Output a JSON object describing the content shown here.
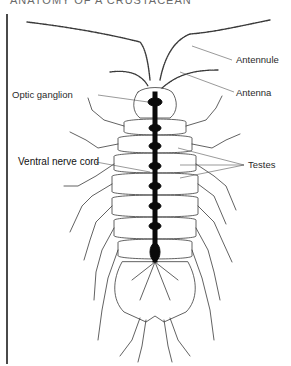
{
  "header": {
    "text": "ANATOMY OF A CRUSTACEAN"
  },
  "diagram": {
    "subject": "crustacean",
    "labels": [
      {
        "id": "antennule",
        "text": "Antennule"
      },
      {
        "id": "antenna",
        "text": "Antenna"
      },
      {
        "id": "optic-ganglion",
        "text": "Optic ganglion"
      },
      {
        "id": "ventral-nerve-cord",
        "text": "Ventral nerve cord"
      },
      {
        "id": "testes",
        "text": "Testes"
      }
    ],
    "colors": {
      "line": "#3a3a3a",
      "nerve": "#0a0a0a",
      "label": "#2a2a2a",
      "rule": "#4a4a4a"
    }
  }
}
